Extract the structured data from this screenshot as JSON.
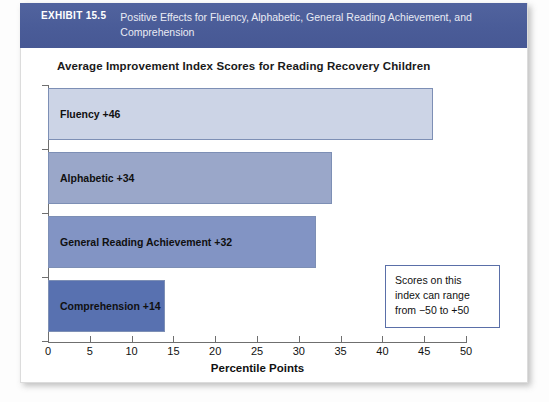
{
  "exhibit": {
    "tag": "EXHIBIT 15.5",
    "title_line1": "Positive Effects for Fluency, Alphabetic, General Reading Achievement, and",
    "title_line2": "Comprehension",
    "header_color": "#4c5f9b"
  },
  "note": {
    "line1": "Scores on this",
    "line2": "index can range",
    "line3": "from −50 to +50"
  },
  "chart_data": {
    "type": "bar",
    "orientation": "horizontal",
    "title": "Average Improvement Index Scores for Reading Recovery Children",
    "xlabel": "Percentile Points",
    "ylabel": "",
    "xlim": [
      0,
      50
    ],
    "xticks": [
      0,
      5,
      10,
      15,
      20,
      25,
      30,
      35,
      40,
      45,
      50
    ],
    "xtick_labels": [
      "0",
      "5",
      "10",
      "15",
      "20",
      "25",
      "30",
      "35",
      "40",
      "45",
      "50"
    ],
    "grid": false,
    "legend": "none",
    "categories": [
      "Fluency",
      "Alphabetic",
      "General Reading Achievement",
      "Comprehension"
    ],
    "values": [
      46,
      34,
      32,
      14
    ],
    "bar_labels": [
      "Fluency +46",
      "Alphabetic +34",
      "General Reading Achievement +32",
      "Comprehension +14"
    ],
    "bar_colors": [
      "#ccd4e6",
      "#9aa7c9",
      "#8294c4",
      "#5871b0"
    ],
    "bar_border_color": "#7d8fb5",
    "annotation": "Scores on this index can range from −50 to +50"
  }
}
